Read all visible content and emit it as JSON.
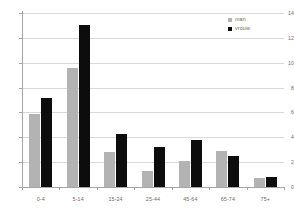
{
  "chart_data": {
    "type": "bar",
    "title": "",
    "subtitle": "",
    "xlabel": "",
    "ylabel": "",
    "categories": [
      "0-4",
      "5-14",
      "15-24",
      "25-44",
      "45-64",
      "65-74",
      "75+"
    ],
    "series": [
      {
        "name": "man",
        "color": "#b3b3b3",
        "values": [
          5.9,
          9.6,
          2.8,
          1.3,
          2.1,
          2.9,
          0.7
        ]
      },
      {
        "name": "vrouw",
        "color": "#0d0d0d",
        "values": [
          7.2,
          13.0,
          4.3,
          3.2,
          3.8,
          2.5,
          0.8
        ]
      }
    ],
    "ylim": [
      0,
      14
    ],
    "ytick_labels": [
      "0",
      "2",
      "4",
      "6",
      "8",
      "10",
      "12",
      "14"
    ],
    "ytick_values": [
      0,
      2,
      4,
      6,
      8,
      10,
      12,
      14
    ],
    "grid": true,
    "grid_axis": "y",
    "legend_position": "top-right",
    "background_color": "#ffffff",
    "grid_color": "#d9d9d9",
    "axis_color": "#a6a6a6",
    "tick_label_color": "#6b6b6b"
  },
  "legend": {
    "entries": [
      {
        "label": "man"
      },
      {
        "label": "vrouw"
      }
    ]
  }
}
